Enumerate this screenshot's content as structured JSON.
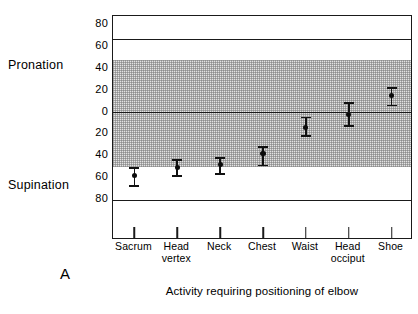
{
  "figure": {
    "panel_letter": "A",
    "xaxis_title": "Activity requiring positioning of elbow",
    "side_labels": {
      "upper": "Pronation",
      "lower": "Supination"
    }
  },
  "chart_data": {
    "type": "scatter",
    "title": "",
    "subtitle": "",
    "xlabel": "Activity requiring positioning of elbow",
    "ylabel": "",
    "ylabel_upper": "Pronation",
    "ylabel_lower": "Supination",
    "grid": false,
    "legend": null,
    "ylim": [
      -88,
      88
    ],
    "yticks": [
      80,
      60,
      40,
      20,
      0,
      20,
      40,
      60,
      80
    ],
    "ytick_values": [
      80,
      60,
      40,
      20,
      0,
      -20,
      -40,
      -60,
      -80
    ],
    "ytick_labels": [
      "80",
      "60",
      "40",
      "20",
      "0",
      "20",
      "40",
      "60",
      "80"
    ],
    "shaded_band": {
      "label": "normal functional range",
      "upper": 48,
      "lower": -50,
      "color": "#e3e3e3"
    },
    "reference_lines": [
      {
        "value": 67,
        "label": "maximum pronation"
      },
      {
        "value": 0,
        "label": "neutral"
      },
      {
        "value": -81,
        "label": "maximum supination"
      }
    ],
    "categories": [
      "Sacrum",
      "Head vertex",
      "Neck",
      "Chest",
      "Waist",
      "Head occiput",
      "Shoe"
    ],
    "category_lines": [
      [
        "Sacrum",
        ""
      ],
      [
        "Head",
        "vertex"
      ],
      [
        "Neck",
        ""
      ],
      [
        "Chest",
        ""
      ],
      [
        "Waist",
        ""
      ],
      [
        "Head",
        "occiput"
      ],
      [
        "Shoe",
        ""
      ]
    ],
    "series": [
      {
        "name": "Mean elbow rotation (degrees)",
        "values": [
          -58,
          -51,
          -48,
          -38,
          -14,
          -2,
          15
        ],
        "error_upper": [
          -51,
          -44,
          -42,
          -32,
          -5,
          8,
          22
        ],
        "error_lower": [
          -68,
          -59,
          -57,
          -49,
          -22,
          -13,
          6
        ],
        "marker": "filled-circle",
        "color": "#111111"
      }
    ]
  }
}
